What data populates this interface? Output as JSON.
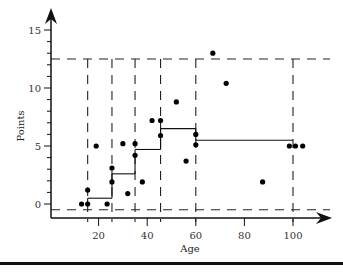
{
  "chart_data": {
    "type": "scatter",
    "title": "",
    "xlabel": "Age",
    "ylabel": "Points",
    "xlim": [
      0,
      110
    ],
    "ylim": [
      -1,
      16
    ],
    "x_ticks": [
      20,
      40,
      60,
      80,
      100
    ],
    "y_ticks": [
      0,
      5,
      10,
      15
    ],
    "grid": false,
    "legend": null,
    "points": [
      {
        "x": 13,
        "y": 0
      },
      {
        "x": 15.5,
        "y": 0
      },
      {
        "x": 15.5,
        "y": 1.2
      },
      {
        "x": 19,
        "y": 5
      },
      {
        "x": 23.5,
        "y": 0
      },
      {
        "x": 25.5,
        "y": 1.9
      },
      {
        "x": 25.5,
        "y": 3.1
      },
      {
        "x": 30,
        "y": 5.2
      },
      {
        "x": 32,
        "y": 0.9
      },
      {
        "x": 35,
        "y": 5.2
      },
      {
        "x": 35,
        "y": 4.2
      },
      {
        "x": 38,
        "y": 1.9
      },
      {
        "x": 42,
        "y": 7.2
      },
      {
        "x": 45.5,
        "y": 7.2
      },
      {
        "x": 45.5,
        "y": 5.9
      },
      {
        "x": 52,
        "y": 8.8
      },
      {
        "x": 56,
        "y": 3.7
      },
      {
        "x": 60,
        "y": 6
      },
      {
        "x": 60,
        "y": 5.1
      },
      {
        "x": 67,
        "y": 13
      },
      {
        "x": 72.5,
        "y": 10.4
      },
      {
        "x": 87.5,
        "y": 1.9
      },
      {
        "x": 98.5,
        "y": 5
      },
      {
        "x": 101,
        "y": 5
      },
      {
        "x": 104,
        "y": 5
      }
    ],
    "partition_lines_x": [
      15.5,
      25.5,
      35,
      45.5,
      60,
      100
    ],
    "partition_lines_y": [
      12.5,
      -0.5
    ],
    "step_segments": [
      {
        "x_start": 15.5,
        "x_end": 25.5,
        "y": 0.5
      },
      {
        "x_start": 25.5,
        "x_end": 35,
        "y": 2.6
      },
      {
        "x_start": 35,
        "x_end": 45.5,
        "y": 4.7
      },
      {
        "x_start": 45.5,
        "x_end": 60,
        "y": 6.5
      },
      {
        "x_start": 60,
        "x_end": 100,
        "y": 5.5
      }
    ]
  }
}
